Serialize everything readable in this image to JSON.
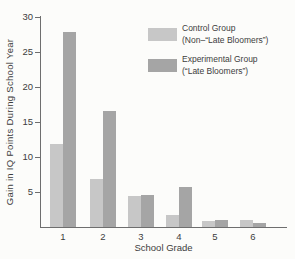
{
  "figure": {
    "background": "#fcfcfa",
    "text_color": "#3d3d3d",
    "axis_color": "#6e6e6e"
  },
  "chart_data": {
    "type": "bar",
    "title": "",
    "xlabel": "School Grade",
    "ylabel": "Gain in IQ Points During School Year",
    "categories": [
      "1",
      "2",
      "3",
      "4",
      "5",
      "6"
    ],
    "series": [
      {
        "name": "Control Group",
        "label_lines": [
          "Control Group",
          "(Non–“Late Bloomers”)"
        ],
        "color": "#c7c7c7",
        "values": [
          11.8,
          6.8,
          4.4,
          1.7,
          0.9,
          1.0
        ]
      },
      {
        "name": "Experimental Group",
        "label_lines": [
          "Experimental Group",
          "(“Late Bloomers”)"
        ],
        "color": "#a5a5a5",
        "values": [
          27.8,
          16.5,
          4.5,
          5.7,
          1.0,
          0.6
        ]
      }
    ],
    "ylim": [
      0,
      30
    ],
    "yticks": [
      5,
      10,
      15,
      20,
      25,
      30
    ],
    "grid": false,
    "legend_position": "top-right"
  }
}
